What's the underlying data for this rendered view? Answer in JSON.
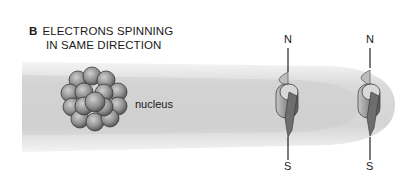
{
  "figure": {
    "panel_letter": "B",
    "title_line1": "ELECTRONS SPINNING",
    "title_line2": "IN SAME DIRECTION",
    "nucleus_label": "nucleus",
    "electrons": [
      {
        "north_label": "N",
        "south_label": "S"
      },
      {
        "north_label": "N",
        "south_label": "S"
      }
    ],
    "colors": {
      "beam": "#d9d9d9",
      "beam_edge": "#efefef",
      "sphere": "#9a9a9a",
      "text": "#1a1a1a"
    }
  }
}
